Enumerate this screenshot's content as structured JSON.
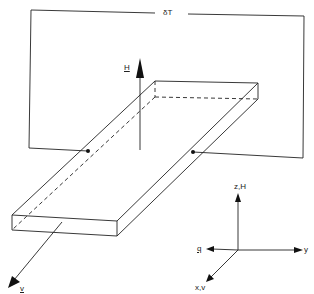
{
  "diagram": {
    "surface_label": "δT",
    "field_label": "H",
    "velocity_label": "v",
    "axes": {
      "z_label": "z,H",
      "y_label": "y",
      "q_label": "q",
      "x_label": "x,v"
    },
    "colors": {
      "line": "#222222",
      "background": "#ffffff"
    }
  }
}
